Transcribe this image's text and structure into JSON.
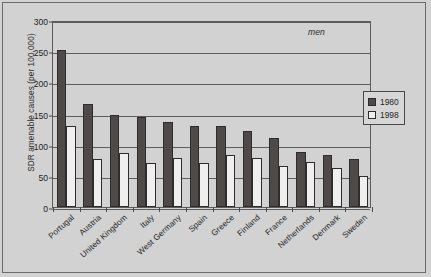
{
  "chart_data": {
    "type": "bar",
    "title": "",
    "subtitle": "",
    "annotation": "men",
    "xlabel": "",
    "ylabel": "SDR amenable causes (per 100,000)",
    "ylim": [
      0,
      300
    ],
    "y_ticks": [
      0,
      50,
      100,
      150,
      200,
      250,
      300
    ],
    "y_tick_labels": [
      "0",
      "50",
      "100",
      "150",
      "200",
      "250",
      "300"
    ],
    "grid": true,
    "legend_position": "right",
    "categories": [
      "Portugal",
      "Austria",
      "United Kingdom",
      "Italy",
      "West Germany",
      "Spain",
      "Greece",
      "Finland",
      "France",
      "Netherlands",
      "Denmark",
      "Sweden"
    ],
    "series": [
      {
        "name": "1980",
        "color": "#4e4a4a",
        "values": [
          252,
          166,
          147,
          145,
          137,
          130,
          130,
          122,
          110,
          89,
          84,
          77
        ]
      },
      {
        "name": "1998",
        "color": "#efefef",
        "values": [
          130,
          77,
          87,
          71,
          78,
          71,
          83,
          79,
          66,
          73,
          63,
          50
        ]
      }
    ]
  },
  "legend": {
    "entries": [
      {
        "label": "1980",
        "swatch": "#4e4a4a"
      },
      {
        "label": "1998",
        "swatch": "#efefef"
      }
    ]
  },
  "colors": {
    "page_background": "#d2d2d2",
    "axis": "#5c5c5c",
    "text": "#1f1f1f"
  }
}
